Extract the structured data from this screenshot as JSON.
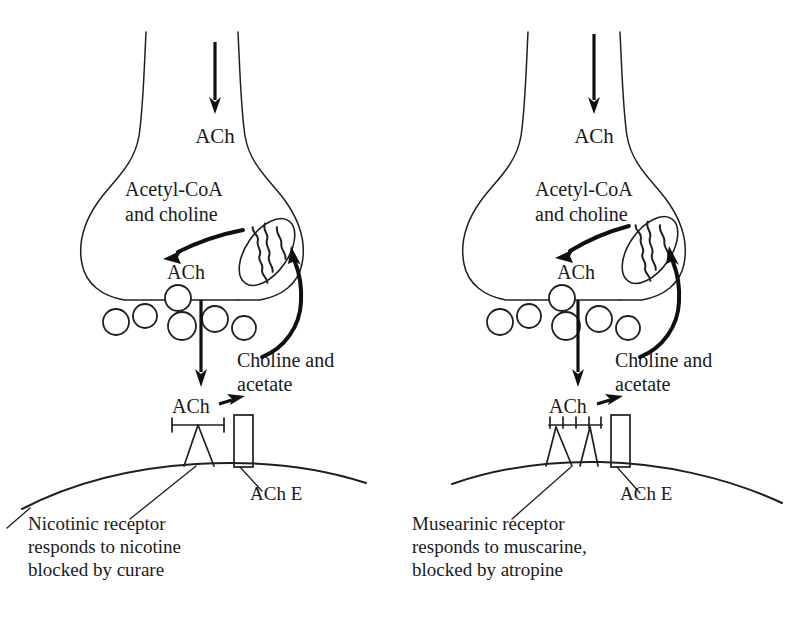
{
  "figure": {
    "background_color": "#ffffff",
    "ink_color": "#1a1a1a",
    "width": 802,
    "height": 618
  },
  "panels": [
    {
      "id": "left",
      "side": "left",
      "labels": {
        "ach_incoming": "ACh",
        "precursor_line1": "Acetyl-CoA",
        "precursor_line2": "and choline",
        "ach_synthesized": "ACh",
        "breakdown_line1": "Choline and",
        "breakdown_line2": "acetate",
        "ach_cleft": "ACh",
        "enzyme": "ACh E"
      },
      "caption": {
        "line1": "Nicotinic receptor",
        "line2": "responds to nicotine",
        "line3": "blocked by curare"
      },
      "receptor_style": "i-beam",
      "vesicle_count": 6
    },
    {
      "id": "right",
      "side": "right",
      "labels": {
        "ach_incoming": "ACh",
        "precursor_line1": "Acetyl-CoA",
        "precursor_line2": "and choline",
        "ach_synthesized": "ACh",
        "breakdown_line1": "Choline and",
        "breakdown_line2": "acetate",
        "ach_cleft": "ACh",
        "enzyme": "ACh E"
      },
      "caption": {
        "line1": "Musearinic receptor",
        "line2": "responds to muscarine,",
        "line3": "blocked by atropine"
      },
      "receptor_style": "comb",
      "vesicle_count": 6
    }
  ]
}
